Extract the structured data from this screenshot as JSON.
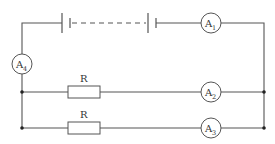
{
  "diagram": {
    "type": "circuit",
    "components": {
      "battery": {
        "label": ""
      },
      "meters": [
        {
          "id": "A1",
          "main": "A",
          "sub": "1"
        },
        {
          "id": "A2",
          "main": "A",
          "sub": "2"
        },
        {
          "id": "A3",
          "main": "A",
          "sub": "3"
        },
        {
          "id": "A4",
          "main": "A",
          "sub": "4"
        }
      ],
      "resistors": [
        {
          "label": "R"
        },
        {
          "label": "R"
        }
      ]
    },
    "colors": {
      "wire": "#555555",
      "junction": "#222222",
      "background": "#ffffff"
    }
  }
}
